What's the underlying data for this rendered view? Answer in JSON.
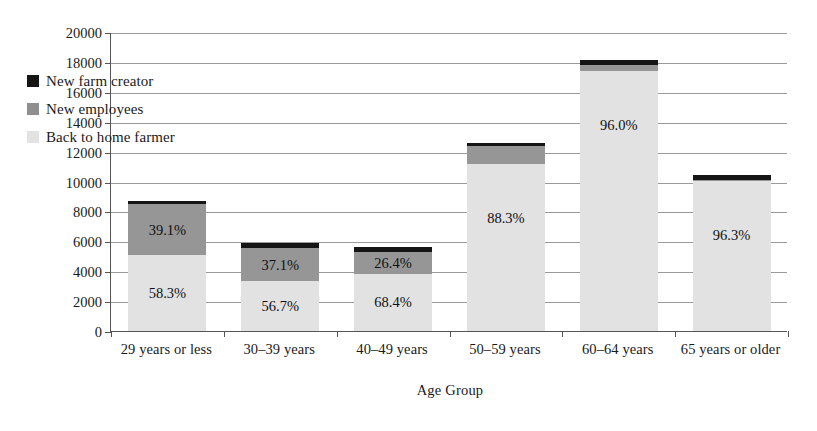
{
  "chart_data": {
    "type": "bar",
    "subtype": "stacked-bar",
    "title": "",
    "xlabel": "Age Group",
    "ylabel": "Number of Persons",
    "ylim": [
      0,
      20000
    ],
    "ytick_step": 2000,
    "yticks": [
      "20000",
      "18000",
      "16000",
      "14000",
      "12000",
      "10000",
      "8000",
      "6000",
      "4000",
      "2000",
      "0"
    ],
    "grid": true,
    "legend_position": "upper-left-inside",
    "categories": [
      "29 years or less",
      "30–39 years",
      "40–49 years",
      "50–59 years",
      "60–64 years",
      "65 years or older"
    ],
    "series": [
      {
        "name": "Back to home farmer",
        "color": "#e2e2e2",
        "values": [
          5080,
          3350,
          3830,
          11150,
          17400,
          10030
        ],
        "data_labels": [
          "58.3%",
          "56.7%",
          "68.4%",
          "88.3%",
          "96.0%",
          "96.3%"
        ]
      },
      {
        "name": "New employees",
        "color": "#969696",
        "values": [
          3400,
          2190,
          1480,
          1240,
          390,
          80
        ],
        "data_labels": [
          "39.1%",
          "37.1%",
          "26.4%",
          "",
          "",
          ""
        ]
      },
      {
        "name": "New farm creator",
        "color": "#151515",
        "values": [
          230,
          360,
          290,
          210,
          330,
          300
        ],
        "data_labels": [
          "",
          "",
          "",
          "",
          "",
          ""
        ]
      }
    ],
    "totals": [
      8710,
      5900,
      5600,
      12600,
      18120,
      10410
    ]
  },
  "legend": {
    "items": [
      {
        "label": "New farm creator",
        "swatch": "sw-new"
      },
      {
        "label": "New employees",
        "swatch": "sw-emp"
      },
      {
        "label": "Back to home farmer",
        "swatch": "sw-home"
      }
    ]
  }
}
